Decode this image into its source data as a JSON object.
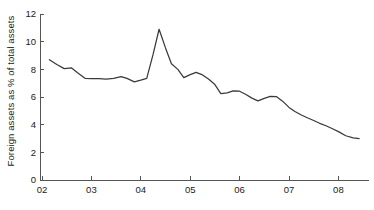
{
  "chart_data": {
    "type": "line",
    "title": "",
    "xlabel": "",
    "ylabel": "Foreign assets as % of total assets",
    "xlim": [
      2002.15,
      2008.45
    ],
    "ylim": [
      0,
      12
    ],
    "grid": false,
    "legend": null,
    "x_tick_labels": [
      "02",
      "03",
      "04",
      "05",
      "06",
      "07",
      "08"
    ],
    "x_tick_values": [
      2002,
      2003,
      2004,
      2005,
      2006,
      2007,
      2008
    ],
    "y_tick_labels": [
      "0",
      "2",
      "4",
      "6",
      "8",
      "10",
      "12"
    ],
    "y_tick_values": [
      0,
      2,
      4,
      6,
      8,
      10,
      12
    ],
    "series": [
      {
        "name": "Foreign assets as % of total assets",
        "color": "#3a3a3a",
        "x": [
          2002.15,
          2002.3,
          2002.45,
          2002.6,
          2002.72,
          2002.87,
          2003.0,
          2003.15,
          2003.3,
          2003.45,
          2003.6,
          2003.72,
          2003.87,
          2004.0,
          2004.12,
          2004.25,
          2004.37,
          2004.5,
          2004.62,
          2004.75,
          2004.87,
          2005.0,
          2005.12,
          2005.25,
          2005.37,
          2005.5,
          2005.62,
          2005.75,
          2005.87,
          2006.0,
          2006.12,
          2006.25,
          2006.37,
          2006.5,
          2006.62,
          2006.75,
          2006.87,
          2007.0,
          2007.12,
          2007.25,
          2007.37,
          2007.5,
          2007.62,
          2007.75,
          2007.87,
          2008.0,
          2008.15,
          2008.3,
          2008.42
        ],
        "y": [
          8.7,
          8.35,
          8.05,
          8.1,
          7.75,
          7.35,
          7.33,
          7.33,
          7.3,
          7.35,
          7.48,
          7.35,
          7.1,
          7.22,
          7.35,
          9.1,
          10.9,
          9.55,
          8.4,
          8.0,
          7.4,
          7.62,
          7.78,
          7.6,
          7.3,
          6.9,
          6.25,
          6.3,
          6.45,
          6.42,
          6.2,
          5.92,
          5.72,
          5.9,
          6.05,
          6.02,
          5.7,
          5.25,
          4.95,
          4.7,
          4.5,
          4.3,
          4.1,
          3.92,
          3.72,
          3.5,
          3.2,
          3.05,
          3.0
        ]
      }
    ]
  }
}
